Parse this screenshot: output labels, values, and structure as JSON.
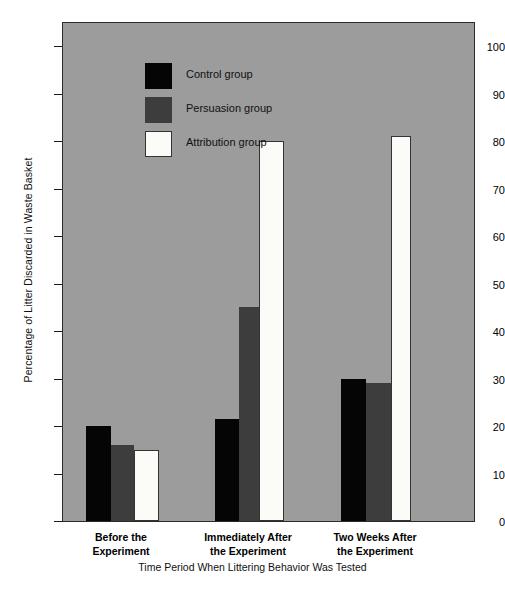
{
  "chart_data": {
    "type": "bar",
    "title": "",
    "xlabel": "Time Period When Littering Behavior Was Tested",
    "ylabel": "Percentage of Litter Discarded in Waste Basket",
    "ylim": [
      0,
      100
    ],
    "yticks": [
      0,
      10,
      20,
      30,
      40,
      50,
      60,
      70,
      80,
      90,
      100
    ],
    "grid": false,
    "legend_position": "inside-top-left",
    "categories": [
      "Before the\nExperiment",
      "Immediately After\nthe Experiment",
      "Two Weeks After\nthe Experiment"
    ],
    "category_lines": [
      [
        "Before the",
        "Experiment"
      ],
      [
        "Immediately After",
        "the Experiment"
      ],
      [
        "Two Weeks After",
        "the Experiment"
      ]
    ],
    "series": [
      {
        "name": "Control group",
        "color": "#050505",
        "values": [
          20,
          21.5,
          30
        ]
      },
      {
        "name": "Persuasion group",
        "color": "#3d3d3d",
        "values": [
          16,
          45,
          29
        ]
      },
      {
        "name": "Attribution group",
        "color": "#fbfbf7",
        "values": [
          15,
          80,
          81
        ]
      }
    ]
  },
  "legend": {
    "items": [
      {
        "label": "Control group",
        "swatch": "control"
      },
      {
        "label": "Persuasion group",
        "swatch": "persuasion"
      },
      {
        "label": "Attribution group",
        "swatch": "attribution"
      }
    ]
  },
  "colors": {
    "plot_background": "#9c9c9c",
    "frame": "#2b2b2b",
    "control": "#050505",
    "persuasion": "#3d3d3d",
    "attribution": "#fbfbf7",
    "page_background": "#ffffff"
  }
}
